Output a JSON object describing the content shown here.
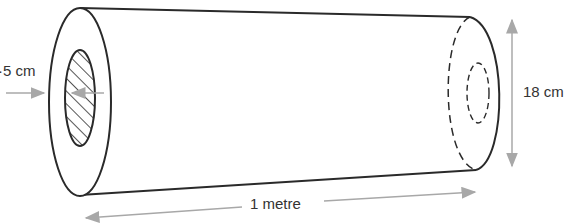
{
  "diagram": {
    "type": "hollow-cylinder",
    "labels": {
      "inner_diameter": "·5 cm",
      "outer_diameter": "18 cm",
      "length": "1 metre"
    },
    "colors": {
      "outline": "#2a2a2a",
      "dimension_arrow": "#a8a8a8",
      "text": "#333333"
    }
  }
}
